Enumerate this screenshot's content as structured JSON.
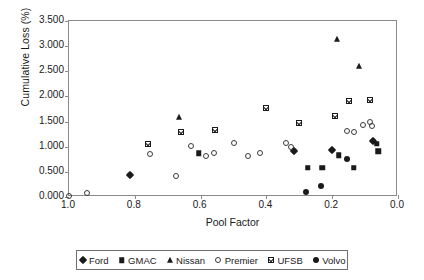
{
  "chart_data": {
    "type": "scatter",
    "title": "",
    "xlabel": "Pool Factor",
    "ylabel": "Cumulative Loss (%)",
    "xlim": [
      1.0,
      0.0
    ],
    "ylim": [
      0.0,
      3.5
    ],
    "x_reversed": true,
    "grid": false,
    "legend_position": "bottom",
    "xticks": [
      "1.0",
      "0.8",
      "0.6",
      "0.4",
      "0.2",
      "0.0"
    ],
    "xtick_values": [
      1.0,
      0.8,
      0.6,
      0.4,
      0.2,
      0.0
    ],
    "yticks": [
      "0.000",
      "0.500",
      "1.000",
      "1.500",
      "2.000",
      "2.500",
      "3.000",
      "3.500"
    ],
    "ytick_values": [
      0.0,
      0.5,
      1.0,
      1.5,
      2.0,
      2.5,
      3.0,
      3.5
    ],
    "series": [
      {
        "name": "Ford",
        "marker": "filled-diamond",
        "color": "#1a1a1a",
        "points": [
          [
            0.815,
            0.435
          ],
          [
            0.315,
            0.905
          ],
          [
            0.2,
            0.935
          ],
          [
            0.075,
            1.11
          ]
        ]
      },
      {
        "name": "GMAC",
        "marker": "filled-square",
        "color": "#1a1a1a",
        "points": [
          [
            0.605,
            0.875
          ],
          [
            0.275,
            0.58
          ],
          [
            0.23,
            0.585
          ],
          [
            0.18,
            0.83
          ],
          [
            0.135,
            0.585
          ],
          [
            0.065,
            1.055
          ],
          [
            0.06,
            0.905
          ]
        ]
      },
      {
        "name": "Nissan",
        "marker": "filled-triangle",
        "color": "#1a1a1a",
        "points": [
          [
            0.665,
            1.59
          ],
          [
            0.185,
            3.15
          ],
          [
            0.12,
            2.605
          ]
        ]
      },
      {
        "name": "Premier",
        "marker": "open-circle",
        "color": "#3a3a3a",
        "points": [
          [
            1.0,
            0.02
          ],
          [
            0.945,
            0.075
          ],
          [
            0.755,
            0.86
          ],
          [
            0.675,
            0.415
          ],
          [
            0.63,
            1.01
          ],
          [
            0.585,
            0.825
          ],
          [
            0.56,
            0.88
          ],
          [
            0.5,
            1.08
          ],
          [
            0.455,
            0.81
          ],
          [
            0.42,
            0.87
          ],
          [
            0.34,
            1.075
          ],
          [
            0.325,
            1.0
          ],
          [
            0.155,
            1.31
          ],
          [
            0.135,
            1.285
          ],
          [
            0.105,
            1.435
          ],
          [
            0.085,
            1.49
          ],
          [
            0.08,
            1.41
          ]
        ]
      },
      {
        "name": "UFSB",
        "marker": "crossed-square",
        "color": "#1a1a1a",
        "points": [
          [
            0.76,
            1.06
          ],
          [
            0.66,
            1.3
          ],
          [
            0.555,
            1.34
          ],
          [
            0.4,
            1.76
          ],
          [
            0.3,
            1.465
          ],
          [
            0.19,
            1.61
          ],
          [
            0.15,
            1.905
          ],
          [
            0.085,
            1.92
          ]
        ]
      },
      {
        "name": "Volvo",
        "marker": "filled-circle",
        "color": "#1a1a1a",
        "points": [
          [
            0.28,
            0.1
          ],
          [
            0.235,
            0.215
          ],
          [
            0.155,
            0.75
          ]
        ]
      }
    ]
  },
  "legend": {
    "items": [
      {
        "label": "Ford",
        "marker": "filled-diamond"
      },
      {
        "label": "GMAC",
        "marker": "filled-square"
      },
      {
        "label": "Nissan",
        "marker": "filled-triangle"
      },
      {
        "label": "Premier",
        "marker": "open-circle"
      },
      {
        "label": "UFSB",
        "marker": "crossed-square"
      },
      {
        "label": "Volvo",
        "marker": "filled-circle"
      }
    ]
  },
  "colors": {
    "marker": "#1a1a1a",
    "axis": "#8a8a8a",
    "text": "#1a1a1a",
    "legend_border": "#6e6e6e",
    "background": "#ffffff"
  }
}
